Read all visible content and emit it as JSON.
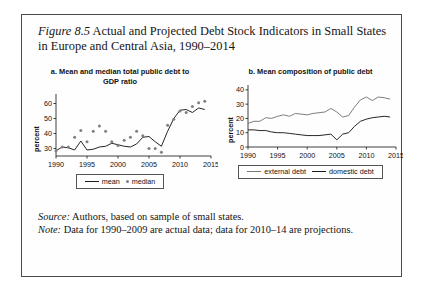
{
  "figure": {
    "label": "Figure 8.5",
    "title": "Actual and Projected Debt Stock Indicators in Small States in Europe and Central Asia, 1990–2014"
  },
  "notes": {
    "source_lead": "Source:",
    "source_text": " Authors, based on sample of small states.",
    "note_lead": "Note:",
    "note_text": " Data for 1990–2009 are actual data; data for 2010–14 are projections."
  },
  "panel_a": {
    "title": "a. Mean and median total public debt to GDP ratio",
    "ylabel": "percent",
    "legend": [
      {
        "label": "mean",
        "marker": "line",
        "color": "#1a1a1a"
      },
      {
        "label": "median",
        "marker": "dot",
        "color": "#808080"
      }
    ]
  },
  "panel_b": {
    "title": "b. Mean composition of public debt",
    "ylabel": "percent",
    "legend": [
      {
        "label": "external debt",
        "marker": "line",
        "color": "#777777"
      },
      {
        "label": "domestic debt",
        "marker": "line",
        "color": "#1a1a1a"
      }
    ]
  },
  "chart_data": [
    {
      "type": "line",
      "panel": "a",
      "title": "a. Mean and median total public debt to GDP ratio",
      "xlabel": "",
      "ylabel": "percent",
      "xlim": [
        1990,
        2015
      ],
      "ylim": [
        25,
        65
      ],
      "yticks": [
        30,
        40,
        50,
        60
      ],
      "xticks": [
        1990,
        1995,
        2000,
        2005,
        2010,
        2015
      ],
      "grid": false,
      "legend_position": "below",
      "x": [
        1990,
        1991,
        1992,
        1993,
        1994,
        1995,
        1996,
        1997,
        1998,
        1999,
        2000,
        2001,
        2002,
        2003,
        2004,
        2005,
        2006,
        2007,
        2008,
        2009,
        2010,
        2011,
        2012,
        2013,
        2014
      ],
      "series": [
        {
          "name": "mean",
          "type": "line",
          "color": "#1a1a1a",
          "values": [
            28.5,
            31.0,
            30.5,
            29.0,
            35.0,
            29.0,
            29.5,
            31.0,
            31.5,
            33.5,
            32.5,
            31.5,
            31.0,
            33.0,
            37.5,
            38.0,
            34.5,
            31.5,
            41.5,
            50.0,
            55.5,
            56.0,
            54.0,
            57.0,
            56.0
          ]
        },
        {
          "name": "median",
          "type": "scatter",
          "color": "#808080",
          "values": [
            28.5,
            31.0,
            31.0,
            37.5,
            42.0,
            34.5,
            41.5,
            45.0,
            41.5,
            34.5,
            32.0,
            35.5,
            37.5,
            41.5,
            38.5,
            30.0,
            30.0,
            27.5,
            45.5,
            49.5,
            55.0,
            54.0,
            58.0,
            60.5,
            61.5
          ]
        }
      ]
    },
    {
      "type": "line",
      "panel": "b",
      "title": "b. Mean composition of public debt",
      "xlabel": "",
      "ylabel": "percent",
      "xlim": [
        1990,
        2015
      ],
      "ylim": [
        0,
        42
      ],
      "yticks": [
        0,
        10,
        20,
        30,
        40
      ],
      "xticks": [
        1990,
        1995,
        2000,
        2005,
        2010,
        2015
      ],
      "grid": false,
      "legend_position": "below",
      "x": [
        1990,
        1991,
        1992,
        1993,
        1994,
        1995,
        1996,
        1997,
        1998,
        1999,
        2000,
        2001,
        2002,
        2003,
        2004,
        2005,
        2006,
        2007,
        2008,
        2009,
        2010,
        2011,
        2012,
        2013,
        2014
      ],
      "series": [
        {
          "name": "external debt",
          "type": "line",
          "color": "#777777",
          "values": [
            16.5,
            18.0,
            18.0,
            20.5,
            20.0,
            21.5,
            22.5,
            21.5,
            23.5,
            23.0,
            22.5,
            23.5,
            24.0,
            24.5,
            27.0,
            24.5,
            21.0,
            22.0,
            28.0,
            33.0,
            35.0,
            32.5,
            35.0,
            34.5,
            33.5
          ]
        },
        {
          "name": "domestic debt",
          "type": "line",
          "color": "#1a1a1a",
          "values": [
            12.0,
            12.0,
            11.5,
            11.5,
            10.5,
            10.0,
            10.0,
            9.5,
            9.0,
            8.5,
            8.0,
            8.0,
            8.0,
            8.5,
            9.0,
            5.0,
            9.0,
            10.0,
            14.5,
            18.0,
            19.5,
            20.5,
            21.0,
            21.5,
            21.0
          ]
        }
      ]
    }
  ]
}
